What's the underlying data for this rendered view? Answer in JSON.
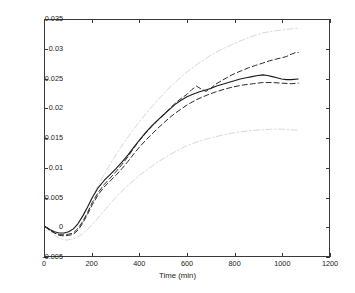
{
  "chart_data": {
    "type": "line",
    "title": "",
    "subtitle": "",
    "xlabel": "Time (min)",
    "ylabel": "",
    "xlim": [
      0,
      1200
    ],
    "ylim": [
      -0.005,
      0.035
    ],
    "xticks": [
      0,
      200,
      400,
      600,
      800,
      1000,
      1200
    ],
    "xticklabels": [
      "0",
      "200",
      "400",
      "600",
      "800",
      "1000",
      "1200"
    ],
    "yticks": [
      -0.005,
      0,
      0.005,
      0.01,
      0.015,
      0.02,
      0.025,
      0.03,
      0.035
    ],
    "yticklabels": [
      "-0.005",
      "0",
      "0.005",
      "0.01",
      "0.015",
      "0.02",
      "0.025",
      "0.03",
      "0.035"
    ],
    "grid": false,
    "legend": null,
    "legend_position": "none",
    "annotations": [],
    "colors": {
      "axis": "#3a3a3a",
      "mean_line": "#1a1a1a",
      "dashed_line": "#2b2b2b",
      "outer_band": "#d8d8d8",
      "background": "#ffffff"
    },
    "series": [
      {
        "name": "mean",
        "style": "solid",
        "color": "#1a1a1a",
        "linewidth": 1.1,
        "x": [
          0,
          20,
          40,
          60,
          80,
          100,
          120,
          140,
          160,
          180,
          200,
          225,
          250,
          275,
          300,
          325,
          350,
          375,
          400,
          425,
          450,
          475,
          500,
          525,
          550,
          575,
          600,
          625,
          650,
          675,
          700,
          725,
          750,
          775,
          800,
          825,
          850,
          875,
          900,
          920,
          940,
          960,
          980,
          1000,
          1020,
          1040,
          1070
        ],
        "y": [
          0.0,
          -0.0005,
          -0.0009,
          -0.0011,
          -0.0011,
          -0.0009,
          -0.0004,
          0.0005,
          0.0018,
          0.0033,
          0.0049,
          0.0066,
          0.0078,
          0.0088,
          0.0098,
          0.0109,
          0.0121,
          0.0134,
          0.0147,
          0.0159,
          0.017,
          0.018,
          0.0189,
          0.0198,
          0.0207,
          0.0214,
          0.022,
          0.0224,
          0.0228,
          0.0231,
          0.0234,
          0.0238,
          0.0241,
          0.0244,
          0.0247,
          0.025,
          0.0252,
          0.0254,
          0.0256,
          0.0257,
          0.0256,
          0.0254,
          0.0252,
          0.025,
          0.0249,
          0.0249,
          0.025
        ]
      },
      {
        "name": "upper-dashed",
        "style": "dashed",
        "color": "#2b2b2b",
        "linewidth": 1.0,
        "x": [
          0,
          20,
          40,
          60,
          80,
          100,
          120,
          140,
          160,
          180,
          200,
          225,
          250,
          275,
          300,
          325,
          350,
          375,
          400,
          425,
          450,
          475,
          500,
          525,
          550,
          575,
          600,
          620,
          640,
          660,
          680,
          700,
          720,
          750,
          780,
          800,
          830,
          860,
          890,
          920,
          950,
          980,
          1000,
          1020,
          1040,
          1060,
          1070
        ],
        "y": [
          0.0,
          -0.0006,
          -0.0011,
          -0.0014,
          -0.0014,
          -0.0013,
          -0.0011,
          -0.0003,
          0.0009,
          0.0024,
          0.0041,
          0.0058,
          0.0071,
          0.0082,
          0.0093,
          0.0105,
          0.0118,
          0.0133,
          0.0146,
          0.0158,
          0.0169,
          0.0179,
          0.0189,
          0.0199,
          0.0209,
          0.0217,
          0.0224,
          0.0232,
          0.0238,
          0.0233,
          0.0229,
          0.0234,
          0.0241,
          0.0248,
          0.0255,
          0.0259,
          0.0264,
          0.0269,
          0.0273,
          0.0277,
          0.0281,
          0.0284,
          0.0286,
          0.0288,
          0.0292,
          0.0295,
          0.0295
        ]
      },
      {
        "name": "lower-dashed",
        "style": "dashed",
        "color": "#2b2b2b",
        "linewidth": 1.0,
        "x": [
          0,
          20,
          40,
          60,
          80,
          100,
          120,
          140,
          160,
          180,
          200,
          225,
          250,
          275,
          300,
          325,
          350,
          375,
          400,
          425,
          450,
          475,
          500,
          525,
          550,
          575,
          600,
          640,
          680,
          720,
          760,
          800,
          840,
          880,
          920,
          960,
          1000,
          1040,
          1070
        ],
        "y": [
          0.0,
          -0.0006,
          -0.0011,
          -0.0015,
          -0.0016,
          -0.0015,
          -0.0013,
          -0.0006,
          0.0006,
          0.0021,
          0.0037,
          0.0054,
          0.0067,
          0.0077,
          0.0087,
          0.0098,
          0.011,
          0.0123,
          0.0135,
          0.0146,
          0.0156,
          0.0166,
          0.0175,
          0.0184,
          0.0192,
          0.0199,
          0.0206,
          0.0215,
          0.0222,
          0.0228,
          0.0233,
          0.0237,
          0.024,
          0.0242,
          0.0244,
          0.0244,
          0.0243,
          0.0242,
          0.0243
        ]
      },
      {
        "name": "outer-upper-band",
        "style": "dashdot",
        "color": "#d8d8d8",
        "linewidth": 1.0,
        "x": [
          0,
          30,
          60,
          90,
          120,
          150,
          180,
          210,
          240,
          280,
          320,
          360,
          400,
          440,
          480,
          520,
          560,
          600,
          640,
          680,
          720,
          760,
          800,
          840,
          880,
          920,
          960,
          1000,
          1040,
          1070
        ],
        "y": [
          0.0,
          -0.0009,
          -0.0013,
          -0.0012,
          -0.0004,
          0.0012,
          0.0034,
          0.0058,
          0.0081,
          0.0109,
          0.0134,
          0.0157,
          0.0178,
          0.0198,
          0.0216,
          0.0233,
          0.0248,
          0.0262,
          0.0274,
          0.0285,
          0.0295,
          0.0303,
          0.031,
          0.0317,
          0.0323,
          0.0328,
          0.0331,
          0.0333,
          0.0335,
          0.0336
        ]
      },
      {
        "name": "outer-lower-band",
        "style": "dashdot",
        "color": "#d8d8d8",
        "linewidth": 1.0,
        "x": [
          0,
          30,
          60,
          90,
          120,
          150,
          180,
          210,
          240,
          280,
          320,
          360,
          400,
          440,
          480,
          520,
          560,
          600,
          640,
          680,
          720,
          760,
          800,
          840,
          880,
          920,
          960,
          1000,
          1040,
          1070
        ],
        "y": [
          0.0,
          -0.0012,
          -0.002,
          -0.0023,
          -0.0021,
          -0.0015,
          -0.0005,
          0.0008,
          0.0022,
          0.0041,
          0.0058,
          0.0073,
          0.0087,
          0.0099,
          0.011,
          0.012,
          0.0129,
          0.0137,
          0.0143,
          0.0148,
          0.0152,
          0.0156,
          0.0159,
          0.0161,
          0.0163,
          0.0164,
          0.0165,
          0.0165,
          0.0164,
          0.0163
        ]
      }
    ]
  }
}
